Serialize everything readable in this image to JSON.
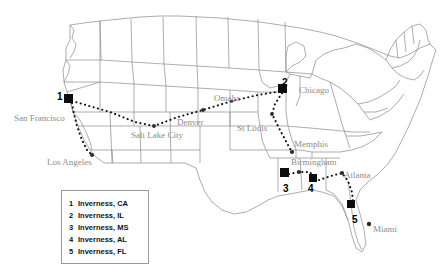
{
  "map": {
    "title": "United States map with Inverness locations",
    "background_color": "#ffffff",
    "state_outline_color": "#8a8a8a",
    "route_color": "#111111",
    "marker_color": "#0d0d0d",
    "city_label_color": "#8c8c8c",
    "numeral_color": "#000000"
  },
  "city_labels": [
    {
      "name": "San Francisco",
      "x": 14,
      "y": 114
    },
    {
      "name": "Los Angeles",
      "x": 47,
      "y": 158
    },
    {
      "name": "Salt Lake City",
      "x": 131,
      "y": 131
    },
    {
      "name": "Denver",
      "x": 177,
      "y": 118
    },
    {
      "name": "Omaha",
      "x": 214,
      "y": 94
    },
    {
      "name": "St Louis",
      "x": 237,
      "y": 124
    },
    {
      "name": "Chicago",
      "x": 299,
      "y": 86
    },
    {
      "name": "Memphis",
      "x": 294,
      "y": 140
    },
    {
      "name": "Birmingham",
      "x": 291,
      "y": 158
    },
    {
      "name": "Atlanta",
      "x": 344,
      "y": 171
    },
    {
      "name": "Miami",
      "x": 373,
      "y": 225
    }
  ],
  "site_markers": [
    {
      "number": "1",
      "x": 68,
      "y": 98,
      "size": 9,
      "num_x": 57,
      "num_y": 92
    },
    {
      "number": "2",
      "x": 282,
      "y": 88,
      "size": 9,
      "num_x": 282,
      "num_y": 78
    },
    {
      "number": "3",
      "x": 284,
      "y": 172,
      "size": 9,
      "num_x": 283,
      "num_y": 184
    },
    {
      "number": "4",
      "x": 313,
      "y": 178,
      "size": 8,
      "num_x": 308,
      "num_y": 184
    },
    {
      "number": "5",
      "x": 351,
      "y": 204,
      "size": 8,
      "num_x": 352,
      "num_y": 215
    }
  ],
  "routes": [
    {
      "name": "sanfrancisco-saltlake-denver-omaha-chicago",
      "points": "72,101 110,112 135,122 154,126 178,117 203,110 232,101 258,95 282,91"
    },
    {
      "name": "sanfrancisco-losangeles",
      "points": "72,103 74,114 77,126 82,140 87,150 92,155"
    },
    {
      "name": "chicago-stlouis-memphis",
      "points": "282,93 275,104 272,114 280,130 288,145 292,152"
    },
    {
      "name": "inverness-ms-birmingham-inverness-al",
      "points": "289,174 299,172 310,172 313,176"
    },
    {
      "name": "inverness-al-atlanta-inverness-fl",
      "points": "319,180 331,176 342,173 348,181 352,192 353,201"
    }
  ],
  "legend": {
    "items": [
      {
        "number": "1",
        "label": "Inverness, CA"
      },
      {
        "number": "2",
        "label": "Inverness, IL"
      },
      {
        "number": "3",
        "label": "Inverness, MS"
      },
      {
        "number": "4",
        "label": "Inverness, AL"
      },
      {
        "number": "5",
        "label": "Inverness, FL"
      }
    ]
  }
}
